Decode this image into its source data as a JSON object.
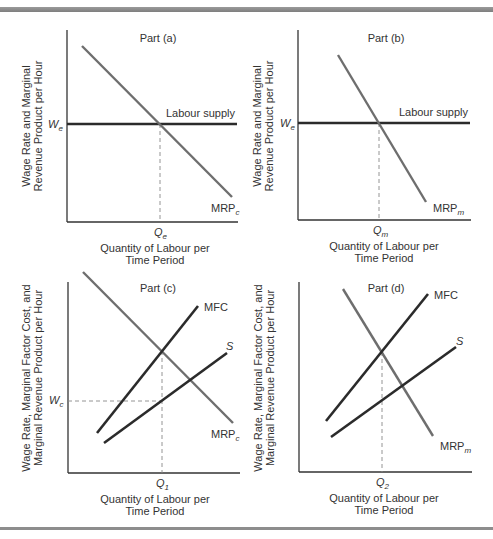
{
  "figure": {
    "panels": [
      {
        "id": "a",
        "title": "Part (a)",
        "ylabel_line1": "Wage Rate and Marginal",
        "ylabel_line2": "Revenue Product per Hour",
        "xlabel_line1": "Quantity of Labour per",
        "xlabel_line2": "Time Period",
        "wage_label": "W",
        "wage_sub": "e",
        "q_label": "Q",
        "q_sub": "e",
        "supply_label": "Labour supply",
        "mrp_label": "MRP",
        "mrp_sub": "c"
      },
      {
        "id": "b",
        "title": "Part (b)",
        "ylabel_line1": "Wage Rate and Marginal",
        "ylabel_line2": "Revenue Product per Hour",
        "xlabel_line1": "Quantity of Labour per",
        "xlabel_line2": "Time Period",
        "wage_label": "W",
        "wage_sub": "e",
        "q_label": "Q",
        "q_sub": "m",
        "supply_label": "Labour supply",
        "mrp_label": "MRP",
        "mrp_sub": "m"
      },
      {
        "id": "c",
        "title": "Part (c)",
        "ylabel_line1": "Wage Rate, Marginal Factor Cost, and",
        "ylabel_line2": "Marginal Revenue Product per Hour",
        "xlabel_line1": "Quantity of Labour per",
        "xlabel_line2": "Time Period",
        "wage_label": "W",
        "wage_sub": "c",
        "q_label": "Q",
        "q_sub": "1",
        "mfc_label": "MFC",
        "s_label": "S",
        "mrp_label": "MRP",
        "mrp_sub": "c"
      },
      {
        "id": "d",
        "title": "Part (d)",
        "ylabel_line1": "Wage Rate, Marginal Factor Cost, and",
        "ylabel_line2": "Marginal Revenue Product per Hour",
        "xlabel_line1": "Quantity of Labour per",
        "xlabel_line2": "Time Period",
        "q_label": "Q",
        "q_sub": "2",
        "mfc_label": "MFC",
        "s_label": "S",
        "mrp_label": "MRP",
        "mrp_sub": "m"
      }
    ]
  },
  "colors": {
    "curve_dark": "#2b2b2b",
    "curve_gray": "#6e6e6e",
    "axis": "#333333",
    "rule": "#8a8a8a"
  }
}
